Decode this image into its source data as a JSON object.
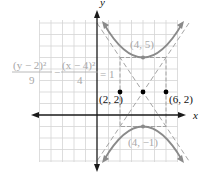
{
  "diagram": {
    "type": "hyperbola-graph",
    "axis_labels": {
      "x": "x",
      "y": "y"
    },
    "equation": {
      "term1_num": "(y − 2)²",
      "term1_den": "9",
      "minus": "−",
      "term2_num": "(x − 4)²",
      "term2_den": "4",
      "rhs": "= 1"
    },
    "points": [
      {
        "label": "(2, 2)",
        "x": 2,
        "y": 2
      },
      {
        "label": "(6, 2)",
        "x": 6,
        "y": 2
      },
      {
        "label": "",
        "x": 4,
        "y": 2
      }
    ],
    "vertices": [
      {
        "label": "(4, 5)",
        "x": 4,
        "y": 5
      },
      {
        "label": "(4, −1)",
        "x": 4,
        "y": -1
      }
    ],
    "center": {
      "x": 4,
      "y": 2
    },
    "a": 3,
    "b": 2,
    "colors": {
      "grid": "#d4d4d4",
      "axis": "#1a1a1a",
      "curve": "#8a8a8a",
      "asymptote": "#9a9a9a",
      "equation_text": "#a8a8a8",
      "point": "#000000",
      "label": "#111111"
    }
  }
}
